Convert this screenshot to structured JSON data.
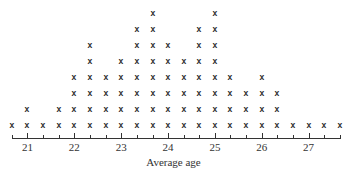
{
  "chart_data": {
    "type": "dot",
    "title": "",
    "xlabel": "Average age",
    "ylabel": "",
    "marker": "x",
    "x": [
      20.67,
      21.0,
      21.33,
      21.67,
      22.0,
      22.33,
      22.67,
      23.0,
      23.33,
      23.67,
      24.0,
      24.33,
      24.67,
      25.0,
      25.33,
      25.67,
      26.0,
      26.33,
      26.67,
      27.0,
      27.33,
      27.67
    ],
    "counts": [
      1,
      2,
      1,
      2,
      4,
      6,
      4,
      5,
      7,
      8,
      6,
      5,
      7,
      8,
      4,
      3,
      4,
      3,
      1,
      1,
      1,
      1
    ],
    "xticks": [
      21,
      22,
      23,
      24,
      25,
      26,
      27
    ],
    "xtick_labels": [
      "21",
      "22",
      "23",
      "24",
      "25",
      "26",
      "27"
    ],
    "minor_tick_step": 0.3333,
    "xlim": [
      20.67,
      27.67
    ],
    "grid": false,
    "legend": null
  },
  "axis": {
    "label": "Average age",
    "tick_labels": [
      "21",
      "22",
      "23",
      "24",
      "25",
      "26",
      "27"
    ]
  }
}
